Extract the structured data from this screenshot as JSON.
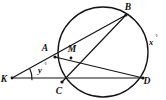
{
  "figure": {
    "type": "euclidean-geometry-diagram",
    "background_color": "#ffffff",
    "stroke_color": "#141414"
  },
  "circle": {
    "name": "main-circle",
    "center_x": 103,
    "center_y": 52,
    "radius": 45
  },
  "points": {
    "A": {
      "label": "A",
      "x": 55,
      "y": 57,
      "label_x": 45,
      "label_y": 51,
      "on_circle": true
    },
    "B": {
      "label": "B",
      "x": 126,
      "y": 15,
      "label_x": 128,
      "label_y": 10,
      "on_circle": true
    },
    "C": {
      "label": "C",
      "x": 62,
      "y": 82,
      "label_x": 59,
      "label_y": 94,
      "on_circle": true
    },
    "D": {
      "label": "D",
      "x": 143,
      "y": 78,
      "label_x": 147,
      "label_y": 84,
      "on_circle": true
    },
    "M": {
      "label": "M",
      "x": 71,
      "y": 58,
      "label_x": 72,
      "label_y": 52,
      "on_circle": false
    },
    "K": {
      "label": "K",
      "x": 12,
      "y": 78,
      "label_x": 4,
      "label_y": 82,
      "on_circle": false
    }
  },
  "segments": [
    {
      "name": "segment-K-to-B",
      "from": "K",
      "to": "B",
      "through": "A"
    },
    {
      "name": "segment-K-to-D",
      "from": "K",
      "to": "D",
      "through": "C"
    },
    {
      "name": "chord-A-to-D",
      "from": "A",
      "to": "D"
    },
    {
      "name": "chord-C-to-B",
      "from": "C",
      "to": "B"
    }
  ],
  "angle_labels": {
    "x": {
      "value": "x",
      "degree_symbol": "°",
      "x": 151,
      "y": 45,
      "description": "exterior arc angle at right of circle"
    },
    "y": {
      "value": "y",
      "degree_symbol": "°",
      "x": 40,
      "y": 72,
      "description": "angle at external point K"
    }
  },
  "angle_arc": {
    "name": "angle-arc-at-K",
    "vertex": "K",
    "radius": 20
  }
}
